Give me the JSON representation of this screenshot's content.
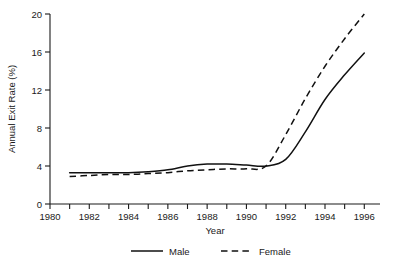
{
  "chart_data": {
    "type": "line",
    "title": "",
    "xlabel": "Year",
    "ylabel": "Annual Exit Rate (%)",
    "xlim": [
      1980,
      1996.8
    ],
    "ylim": [
      0,
      20
    ],
    "grid": false,
    "legend_position": "bottom-center",
    "x_ticks_major": [
      1980,
      1982,
      1984,
      1986,
      1988,
      1990,
      1992,
      1994,
      1996
    ],
    "x_ticks_major_labels": [
      "1980",
      "1982",
      "1984",
      "1986",
      "1988",
      "1990",
      "1992",
      "1994",
      "1996"
    ],
    "x_ticks_minor": [
      1981,
      1983,
      1985,
      1987,
      1989,
      1991,
      1993,
      1995
    ],
    "y_ticks": [
      0,
      4,
      8,
      12,
      16,
      20
    ],
    "y_tick_labels": [
      "0",
      "4",
      "8",
      "12",
      "16",
      "20"
    ],
    "x": [
      1981,
      1982,
      1983,
      1984,
      1985,
      1986,
      1987,
      1988,
      1989,
      1990,
      1991,
      1992,
      1993,
      1994,
      1995,
      1996
    ],
    "series": [
      {
        "name": "Male",
        "style": "solid",
        "color": "#111111",
        "values": [
          3.3,
          3.3,
          3.3,
          3.3,
          3.4,
          3.6,
          4.0,
          4.2,
          4.2,
          4.1,
          4.0,
          4.7,
          7.6,
          11.0,
          13.6,
          15.9
        ]
      },
      {
        "name": "Female",
        "style": "dashed",
        "color": "#111111",
        "values": [
          2.9,
          3.0,
          3.1,
          3.1,
          3.2,
          3.3,
          3.5,
          3.6,
          3.7,
          3.7,
          4.0,
          7.3,
          11.1,
          14.5,
          17.4,
          20.0
        ]
      }
    ]
  },
  "legend": {
    "items": [
      {
        "label": "Male",
        "style": "solid"
      },
      {
        "label": "Female",
        "style": "dashed"
      }
    ]
  }
}
